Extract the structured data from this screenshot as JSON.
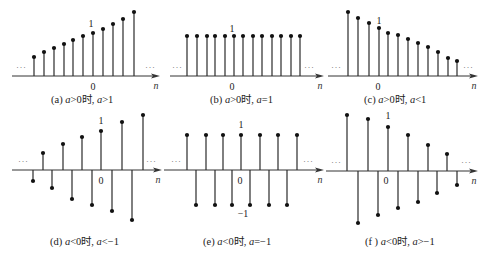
{
  "panels": [
    {
      "id": "a",
      "caption": {
        "prefix": "(a) ",
        "var1": "a",
        "cond1": ">0时, ",
        "var2": "a",
        "cond2": ">1"
      },
      "origin": {
        "x": 0,
        "axis_y": 76,
        "axis_x0": 12,
        "axis_x1": 160
      },
      "n0_x": 93,
      "spacing": 10,
      "one_label": "1",
      "zero_label": "0",
      "n_label": "n",
      "ellipsis": "···",
      "one_label_pos": {
        "x": 91,
        "y": 27
      },
      "zero_label_pos": {
        "x": 93,
        "y": 90
      },
      "ellipsis_left": {
        "x": 16,
        "y": 70
      },
      "ellipsis_right": {
        "x": 145,
        "y": 70
      },
      "caption_pos": {
        "x": 51,
        "y": 91
      }
    },
    {
      "id": "b",
      "caption": {
        "prefix": "(b) ",
        "var1": "a",
        "cond1": ">0时, ",
        "var2": "a",
        "cond2": "=1"
      },
      "origin": {
        "x": 160,
        "axis_y": 76,
        "axis_x0": 170,
        "axis_x1": 324
      },
      "one_label_pos": {
        "x": 232,
        "y": 32
      },
      "zero_label_pos": {
        "x": 232,
        "y": 90
      },
      "ellipsis_left": {
        "x": 172,
        "y": 70
      },
      "ellipsis_right": {
        "x": 304,
        "y": 70
      },
      "caption_pos": {
        "x": 210,
        "y": 91
      },
      "one_label": "1",
      "zero_label": "0",
      "n_label": "n",
      "ellipsis": "···"
    },
    {
      "id": "c",
      "caption": {
        "prefix": "(c) ",
        "var1": "a",
        "cond1": ">0时, ",
        "var2": "a",
        "cond2": "<1"
      },
      "origin": {
        "x": 320,
        "axis_y": 76,
        "axis_x0": 328,
        "axis_x1": 478
      },
      "one_label_pos": {
        "x": 379,
        "y": 24
      },
      "zero_label_pos": {
        "x": 378,
        "y": 90
      },
      "ellipsis_left": {
        "x": 331,
        "y": 70
      },
      "ellipsis_right": {
        "x": 463,
        "y": 70
      },
      "caption_pos": {
        "x": 364,
        "y": 91
      },
      "one_label": "1",
      "zero_label": "0",
      "n_label": "n",
      "ellipsis": "···"
    },
    {
      "id": "d",
      "caption": {
        "prefix": "(d) ",
        "var1": "a",
        "cond1": "<0时, ",
        "var2": "a",
        "cond2": "<−1"
      },
      "origin": {
        "x": 0,
        "axis_y": 170,
        "axis_x0": 12,
        "axis_x1": 162
      },
      "one_label_pos": {
        "x": 101,
        "y": 124
      },
      "zero_label_pos": {
        "x": 101,
        "y": 184
      },
      "ellipsis_left": {
        "x": 18,
        "y": 164
      },
      "ellipsis_right": {
        "x": 146,
        "y": 164
      },
      "caption_pos": {
        "x": 50,
        "y": 233
      },
      "one_label": "1",
      "zero_label": "0",
      "n_label": "n",
      "ellipsis": "···"
    },
    {
      "id": "e",
      "caption": {
        "prefix": "(e) ",
        "var1": "a",
        "cond1": "<0时, ",
        "var2": "a",
        "cond2": "=−1"
      },
      "origin": {
        "x": 160,
        "axis_y": 170,
        "axis_x0": 164,
        "axis_x1": 324
      },
      "one_label_pos": {
        "x": 241,
        "y": 128
      },
      "zero_label_pos": {
        "x": 240,
        "y": 184
      },
      "minus_one_label": "−1",
      "minus_one_label_pos": {
        "x": 243,
        "y": 217
      },
      "ellipsis_left": {
        "x": 171,
        "y": 164
      },
      "ellipsis_right": {
        "x": 303,
        "y": 164
      },
      "caption_pos": {
        "x": 203,
        "y": 233
      },
      "one_label": "1",
      "zero_label": "0",
      "n_label": "n",
      "ellipsis": "···"
    },
    {
      "id": "f",
      "caption": {
        "prefix": "(f ) ",
        "var1": "a",
        "cond1": "<0时, ",
        "var2": "a",
        "cond2": ">−1"
      },
      "origin": {
        "x": 320,
        "axis_y": 171,
        "axis_x0": 326,
        "axis_x1": 478
      },
      "one_label_pos": {
        "x": 388,
        "y": 119
      },
      "zero_label_pos": {
        "x": 386,
        "y": 184
      },
      "ellipsis_left": {
        "x": 331,
        "y": 165
      },
      "ellipsis_right": {
        "x": 461,
        "y": 165
      },
      "caption_pos": {
        "x": 365,
        "y": 233
      },
      "one_label": "1",
      "zero_label": "0",
      "n_label": "n",
      "ellipsis": "···"
    }
  ],
  "chart_data": [
    {
      "type": "stem",
      "title": "(a) a>0时, a>1",
      "xlabel": "n",
      "ylabel": "",
      "x": [
        -6,
        -5,
        -4,
        -3,
        -2,
        -1,
        0,
        1,
        2,
        3,
        4
      ],
      "stem_x_px": [
        34,
        44,
        54,
        64,
        73,
        83,
        93,
        103,
        113,
        123,
        134
      ],
      "values": [
        0.44,
        0.56,
        0.65,
        0.74,
        0.84,
        0.93,
        1.0,
        1.09,
        1.21,
        1.33,
        1.49
      ],
      "heights_px": [
        19,
        24,
        28,
        32,
        36,
        40,
        43,
        47,
        52,
        57,
        64
      ],
      "annotations": [
        "1 at n=0",
        "0",
        "··· (both ends)"
      ]
    },
    {
      "type": "stem",
      "title": "(b) a>0时, a=1",
      "xlabel": "n",
      "ylabel": "",
      "x": [
        -5,
        -4,
        -3,
        -2,
        -1,
        0,
        1,
        2,
        3,
        4,
        5,
        6,
        7
      ],
      "stem_x_px": [
        187,
        197,
        207,
        215,
        225,
        234,
        243,
        253,
        262,
        272,
        281,
        291,
        300
      ],
      "values": [
        1,
        1,
        1,
        1,
        1,
        1,
        1,
        1,
        1,
        1,
        1,
        1,
        1
      ],
      "heights_px": [
        40,
        40,
        40,
        40,
        40,
        40,
        40,
        40,
        40,
        40,
        40,
        40,
        40
      ],
      "annotations": [
        "1 at n=0",
        "0",
        "··· (both ends)"
      ]
    },
    {
      "type": "stem",
      "title": "(c) a>0时, a<1",
      "xlabel": "n",
      "ylabel": "",
      "x": [
        -3,
        -2,
        -1,
        0,
        1,
        2,
        3,
        4,
        5,
        6,
        7,
        8
      ],
      "stem_x_px": [
        348,
        358,
        369,
        379,
        388,
        398,
        408,
        418,
        428,
        438,
        448,
        457
      ],
      "values": [
        1.33,
        1.21,
        1.1,
        1.0,
        0.9,
        0.85,
        0.77,
        0.69,
        0.6,
        0.5,
        0.38,
        0.31
      ],
      "heights_px": [
        64,
        58,
        53,
        48,
        43,
        41,
        37,
        33,
        29,
        24,
        18,
        15
      ],
      "annotations": [
        "1 at n=0",
        "0",
        "··· (both ends)"
      ]
    },
    {
      "type": "stem",
      "title": "(d) a<0时, a<−1",
      "xlabel": "n",
      "ylabel": "",
      "x": [
        -7,
        -6,
        -5,
        -4,
        -3,
        -2,
        -1,
        0,
        1,
        2,
        3,
        4
      ],
      "stem_x_px": [
        33,
        43,
        52,
        63,
        72,
        82,
        92,
        101,
        112,
        122,
        132,
        143
      ],
      "values": [
        -0.28,
        0.44,
        -0.46,
        0.67,
        -0.74,
        0.85,
        -0.9,
        1.0,
        -1.05,
        1.23,
        -1.28,
        1.41
      ],
      "heights_px": [
        -11,
        17,
        -18,
        26,
        -29,
        33,
        -35,
        39,
        -41,
        48,
        -50,
        55
      ],
      "annotations": [
        "1 at n=0",
        "0",
        "··· (both ends)"
      ]
    },
    {
      "type": "stem",
      "title": "(e) a<0时, a=−1",
      "xlabel": "n",
      "ylabel": "",
      "x": [
        -6,
        -5,
        -4,
        -3,
        -2,
        -1,
        0,
        1,
        2,
        3,
        4,
        5,
        6
      ],
      "stem_x_px": [
        187,
        196,
        206,
        215,
        223,
        232,
        241,
        250,
        260,
        269,
        278,
        287,
        297
      ],
      "values": [
        1,
        -1,
        1,
        -1,
        1,
        -1,
        1,
        -1,
        1,
        -1,
        1,
        -1,
        1
      ],
      "heights_px": [
        35,
        -35,
        35,
        -35,
        35,
        -35,
        35,
        -35,
        35,
        -35,
        35,
        -35,
        35
      ],
      "annotations": [
        "1 at n=0",
        "0",
        "−1",
        "··· (both ends)"
      ]
    },
    {
      "type": "stem",
      "title": "(f) a<0时, a>−1",
      "xlabel": "n",
      "ylabel": "",
      "x": [
        -4,
        -3,
        -2,
        -1,
        0,
        1,
        2,
        3,
        4,
        5,
        6,
        7
      ],
      "stem_x_px": [
        347,
        358,
        368,
        378,
        388,
        398,
        408,
        418,
        428,
        437,
        447,
        457
      ],
      "values": [
        1.27,
        -1.18,
        1.18,
        -1.0,
        1.0,
        -0.84,
        0.82,
        -0.7,
        0.59,
        -0.5,
        0.39,
        -0.32
      ],
      "heights_px": [
        56,
        -52,
        52,
        -44,
        44,
        -37,
        36,
        -31,
        26,
        -22,
        17,
        -14
      ],
      "annotations": [
        "1 at n=0",
        "0",
        "··· (both ends)"
      ]
    }
  ]
}
